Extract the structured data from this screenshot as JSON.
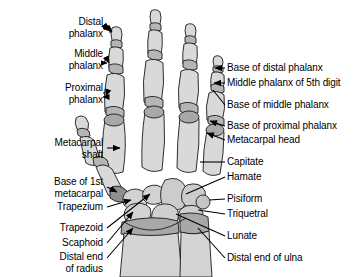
{
  "diagram": {
    "background_color": "#ffffff",
    "bone_fill_light": "#d9d9d9",
    "bone_fill_dark": "#a8a8a8",
    "outline_color": "#1a1a1a",
    "leader_color": "#000000",
    "text_color": "#000000"
  },
  "labels_left": [
    {
      "id": "distal-phalanx",
      "lines": [
        "Distal",
        "phalanx"
      ],
      "x": 103,
      "y": 27
    },
    {
      "id": "middle-phalanx",
      "lines": [
        "Middle",
        "phalanx"
      ],
      "x": 103,
      "y": 59
    },
    {
      "id": "proximal-phalanx",
      "lines": [
        "Proximal",
        "phalanx"
      ],
      "x": 103,
      "y": 93
    },
    {
      "id": "metacarpal-shaft",
      "lines": [
        "Metacarpal",
        "shaft"
      ],
      "x": 103,
      "y": 148
    },
    {
      "id": "base-of-1st-metacarpal",
      "lines": [
        "Base of 1st",
        "metacarpal"
      ],
      "x": 103,
      "y": 187
    },
    {
      "id": "trapezium",
      "lines": [
        "Trapezium"
      ],
      "x": 103,
      "y": 207
    },
    {
      "id": "trapezoid",
      "lines": [
        "Trapezoid"
      ],
      "x": 103,
      "y": 228
    },
    {
      "id": "scaphoid",
      "lines": [
        "Scaphoid"
      ],
      "x": 103,
      "y": 243
    },
    {
      "id": "distal-end-of-radius",
      "lines": [
        "Distal end",
        "of radius"
      ],
      "x": 103,
      "y": 262
    }
  ],
  "labels_right": [
    {
      "id": "base-of-distal-phalanx",
      "text": "Base of distal phalanx",
      "x": 227,
      "y": 68
    },
    {
      "id": "middle-phalanx-of-5th-digit",
      "text": "Middle phalanx of 5th digit",
      "x": 227,
      "y": 83
    },
    {
      "id": "base-of-middle-phalanx",
      "text": "Base of middle phalanx",
      "x": 227,
      "y": 105
    },
    {
      "id": "base-of-proximal-phalanx",
      "text": "Base of proximal phalanx",
      "x": 227,
      "y": 126
    },
    {
      "id": "metacarpal-head",
      "text": "Metacarpal head",
      "x": 227,
      "y": 140
    },
    {
      "id": "capitate",
      "text": "Capitate",
      "x": 227,
      "y": 162
    },
    {
      "id": "hamate",
      "text": "Hamate",
      "x": 227,
      "y": 177
    },
    {
      "id": "pisiform",
      "text": "Pisiform",
      "x": 227,
      "y": 199
    },
    {
      "id": "triquetral",
      "text": "Triquetral",
      "x": 227,
      "y": 214
    },
    {
      "id": "lunate",
      "text": "Lunate",
      "x": 227,
      "y": 236
    },
    {
      "id": "distal-end-of-ulna",
      "text": "Distal end of ulna",
      "x": 227,
      "y": 258
    }
  ]
}
